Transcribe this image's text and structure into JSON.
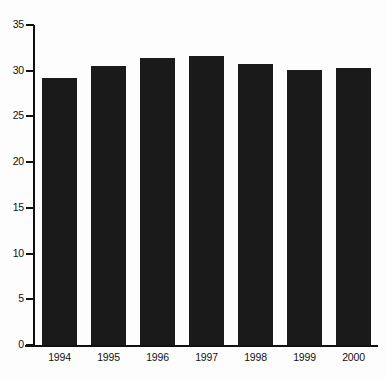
{
  "chart_data": {
    "type": "bar",
    "title": "",
    "subtitle": "",
    "xlabel": "",
    "ylabel": "",
    "categories": [
      "1994",
      "1995",
      "1996",
      "1997",
      "1998",
      "1999",
      "2000"
    ],
    "values": [
      29.2,
      30.5,
      31.4,
      31.6,
      30.7,
      30.1,
      30.3
    ],
    "series": [
      {
        "name": "",
        "values": [
          29.2,
          30.5,
          31.4,
          31.6,
          30.7,
          30.1,
          30.3
        ]
      }
    ],
    "ylim": [
      0,
      35
    ],
    "yticks": [
      0,
      5,
      10,
      15,
      20,
      25,
      30,
      35
    ],
    "ytick_labels": [
      "0",
      "5",
      "10",
      "15",
      "20",
      "25",
      "30",
      "35"
    ],
    "xtick_labels": [
      "1994",
      "1995",
      "1996",
      "1997",
      "1998",
      "1999",
      "2000"
    ],
    "grid": false,
    "legend": false,
    "legend_position": "none",
    "annotations": [],
    "bar_color": "#1a1a1a",
    "axis_color": "#111111",
    "background_color": "#fdfdfd"
  }
}
